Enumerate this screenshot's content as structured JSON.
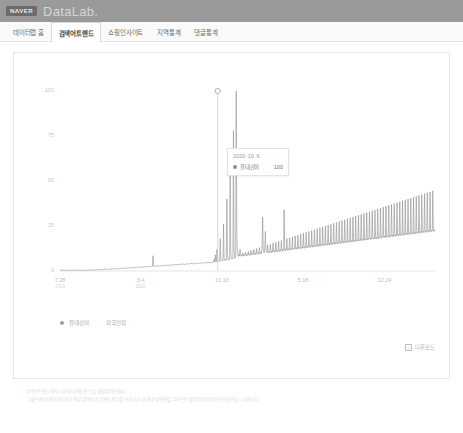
{
  "header": {
    "brand_logo": "NAVER",
    "product_name": "DataLab.",
    "bar_color": "#9a9a9a"
  },
  "nav": {
    "tabs": [
      {
        "label": "데이터랩 홈",
        "active": false
      },
      {
        "label": "검색어트렌드",
        "active": true
      },
      {
        "label": "쇼핑인사이트",
        "active": false
      },
      {
        "label": "지역통계",
        "active": false
      },
      {
        "label": "댓글통계",
        "active": false
      }
    ]
  },
  "tooltip": {
    "date": "2020. 10. 6.",
    "series_name": "유대감이",
    "value": "100",
    "dot_color": "#8e8e8e"
  },
  "legend": {
    "items": [
      {
        "label": "유대감이"
      },
      {
        "label": "외국인의"
      }
    ],
    "dot_color": "#9e9e9e"
  },
  "actions": {
    "download_label": "다운로드",
    "download_icon": "download-icon"
  },
  "footer": {
    "bullet": "·",
    "notes": [
      "검색어트렌드에서 기간과 지역조건 등을 재설정해보세요.",
      "그래프에서 데이터에 대한 해당 검색어가 검색된 횟수를 조회기간 내 최대 검색량을 100으로 설정하여 상대적인 변화량을 나타냅니다."
    ]
  },
  "chart_data": {
    "type": "line",
    "title": "",
    "xlabel": "",
    "ylabel": "",
    "ylim": [
      0,
      100
    ],
    "yticks": [
      100,
      75,
      50,
      25,
      0
    ],
    "grid": false,
    "legend_position": "bottom-left",
    "line_color": "#8e8e8e",
    "xticks": [
      {
        "label": "7.28",
        "year": "2019",
        "pos": 0.0
      },
      {
        "label": "3.4",
        "year": "2020",
        "pos": 0.215
      },
      {
        "label": "10.10",
        "year": "",
        "pos": 0.432
      },
      {
        "label": "5.18",
        "year": "",
        "pos": 0.648
      },
      {
        "label": "12.24",
        "year": "",
        "pos": 0.865
      }
    ],
    "annotations": [
      {
        "label": "2020. 10. 6.",
        "value": 100,
        "x": 0.4205,
        "marker": "hollow-circle"
      }
    ],
    "series": [
      {
        "name": "유대감이",
        "values": [
          0.4,
          0.3,
          0.5,
          0.4,
          0.3,
          0.6,
          0.4,
          0.3,
          0.5,
          0.4,
          0.3,
          0.4,
          0.5,
          0.3,
          0.4,
          0.6,
          0.4,
          0.3,
          0.5,
          0.4,
          0.3,
          0.5,
          0.4,
          0.6,
          0.4,
          0.3,
          0.5,
          0.4,
          0.3,
          0.4,
          0.6,
          0.4,
          0.5,
          0.3,
          0.4,
          0.5,
          0.4,
          0.3,
          0.6,
          0.4,
          0.5,
          0.4,
          0.3,
          0.5,
          0.6,
          0.4,
          0.5,
          0.4,
          0.3,
          0.5,
          0.4,
          0.6,
          0.5,
          0.4,
          0.5,
          0.6,
          0.4,
          0.5,
          0.4,
          0.6,
          0.5,
          0.7,
          0.5,
          0.6,
          0.5,
          0.7,
          0.6,
          0.5,
          0.7,
          0.6,
          0.8,
          0.6,
          0.7,
          0.6,
          0.8,
          0.7,
          0.6,
          0.8,
          0.7,
          0.9,
          0.8,
          1.0,
          1.4,
          0.9,
          0.8,
          1.0,
          0.9,
          1.1,
          1.0,
          1.2,
          1.0,
          0.9,
          1.1,
          1.0,
          1.3,
          1.1,
          1.0,
          1.2,
          1.1,
          1.4,
          1.2,
          1.1,
          1.3,
          1.2,
          1.5,
          1.3,
          1.2,
          1.4,
          1.3,
          1.6,
          1.4,
          1.3,
          1.5,
          1.4,
          1.7,
          1.5,
          1.4,
          1.6,
          1.5,
          1.8,
          1.6,
          1.5,
          1.7,
          1.6,
          1.9,
          1.7,
          1.6,
          1.8,
          1.7,
          2.0,
          1.8,
          1.7,
          1.9,
          1.8,
          2.1,
          1.9,
          1.8,
          2.0,
          1.9,
          2.2,
          2.0,
          1.9,
          2.1,
          2.0,
          2.3,
          2.1,
          2.0,
          2.2,
          2.1,
          2.4,
          2.2,
          2.1,
          2.3,
          2.2,
          2.5,
          2.3,
          2.2,
          2.4,
          2.3,
          2.6,
          2.4,
          2.3,
          2.5,
          2.4,
          2.7,
          2.5,
          2.4,
          2.6,
          2.5,
          8.5,
          3.0,
          2.6,
          2.8,
          2.6,
          3.0,
          2.8,
          2.6,
          2.9,
          2.7,
          3.1,
          2.9,
          2.7,
          3.0,
          2.8,
          3.2,
          3.0,
          2.8,
          3.1,
          2.9,
          3.3,
          3.1,
          2.9,
          3.2,
          3.0,
          3.4,
          3.2,
          3.0,
          3.3,
          3.1,
          3.5,
          3.3,
          3.1,
          3.4,
          3.2,
          3.6,
          3.4,
          3.2,
          3.5,
          3.3,
          3.7,
          3.5,
          3.3,
          3.6,
          3.4,
          3.8,
          3.6,
          3.4,
          3.7,
          3.5,
          3.9,
          3.7,
          3.5,
          3.8,
          3.6,
          4.0,
          3.8,
          3.6,
          3.9,
          3.7,
          4.1,
          3.9,
          3.7,
          4.0,
          3.8,
          4.2,
          4.0,
          3.8,
          4.1,
          3.9,
          4.3,
          4.1,
          3.9,
          4.2,
          4.0,
          4.4,
          4.2,
          4.0,
          4.3,
          4.1,
          4.5,
          4.3,
          4.1,
          4.4,
          4.2,
          4.6,
          4.4,
          4.2,
          4.5,
          4.3,
          4.7,
          4.5,
          4.3,
          4.6,
          4.4,
          4.8,
          4.6,
          4.4,
          4.7,
          4.5,
          4.9,
          4.7,
          4.5,
          4.8,
          4.6,
          5.0,
          4.8,
          4.6,
          4.9,
          4.7,
          5.1,
          6.5,
          5.0,
          9.0,
          5.4,
          5.2,
          12.0,
          6.0,
          5.4,
          5.2,
          5.6,
          5.4,
          18.0,
          6.5,
          5.8,
          5.5,
          6.0,
          5.6,
          26.0,
          7.5,
          6.2,
          5.8,
          6.4,
          6.0,
          40.0,
          9.0,
          6.6,
          6.2,
          6.8,
          6.4,
          58.0,
          11.0,
          7.0,
          6.6,
          7.2,
          6.8,
          78.0,
          14.0,
          8.0,
          7.0,
          8.5,
          100.0,
          22.0,
          12.0,
          9.0,
          8.0,
          9.5,
          8.5,
          12.0,
          9.0,
          8.2,
          9.0,
          8.4,
          10.0,
          8.8,
          8.2,
          9.2,
          8.6,
          10.5,
          9.0,
          8.4,
          9.4,
          8.8,
          11.0,
          9.2,
          8.6,
          9.6,
          9.0,
          11.5,
          9.4,
          8.8,
          9.8,
          9.2,
          12.0,
          9.6,
          9.0,
          10.0,
          9.4,
          12.5,
          9.8,
          9.2,
          10.2,
          9.6,
          13.0,
          10.0,
          9.4,
          10.4,
          9.8,
          13.5,
          30.0,
          12.0,
          10.6,
          10.0,
          14.0,
          22.0,
          11.5,
          10.8,
          10.2,
          14.5,
          10.6,
          10.0,
          11.0,
          10.4,
          15.0,
          10.8,
          10.2,
          11.2,
          10.6,
          15.5,
          11.0,
          10.4,
          11.4,
          10.8,
          16.0,
          11.2,
          10.6,
          11.6,
          11.0,
          16.5,
          11.4,
          10.8,
          11.8,
          11.2,
          17.0,
          11.6,
          11.0,
          12.0,
          11.4,
          34.0,
          13.0,
          11.2,
          12.2,
          11.6,
          18.0,
          12.0,
          11.4,
          12.4,
          11.8,
          18.5,
          12.2,
          11.6,
          12.6,
          12.0,
          19.0,
          12.4,
          11.8,
          12.8,
          12.2,
          19.5,
          12.6,
          12.0,
          13.0,
          12.4,
          20.0,
          12.8,
          12.2,
          13.2,
          12.6,
          20.5,
          13.0,
          12.4,
          13.4,
          12.8,
          21.0,
          13.2,
          12.6,
          13.6,
          13.0,
          21.5,
          13.4,
          12.8,
          13.8,
          13.2,
          22.0,
          13.6,
          13.0,
          14.0,
          13.4,
          22.5,
          13.8,
          13.2,
          14.2,
          13.6,
          23.0,
          14.0,
          13.4,
          14.4,
          13.8,
          23.5,
          14.2,
          13.6,
          14.6,
          14.0,
          24.0,
          14.4,
          13.8,
          14.8,
          14.2,
          24.5,
          14.6,
          14.0,
          15.0,
          14.4,
          25.0,
          14.8,
          14.2,
          15.2,
          14.6,
          25.5,
          15.0,
          14.4,
          15.4,
          14.8,
          26.0,
          15.2,
          14.6,
          15.6,
          15.0,
          26.5,
          15.4,
          14.8,
          15.8,
          15.2,
          27.0,
          15.6,
          15.0,
          16.0,
          15.4,
          27.5,
          15.8,
          15.2,
          16.2,
          15.6,
          28.0,
          16.0,
          15.4,
          16.4,
          15.8,
          28.5,
          16.2,
          15.6,
          16.6,
          16.0,
          29.0,
          16.4,
          15.8,
          16.8,
          16.2,
          29.5,
          16.6,
          16.0,
          17.0,
          16.4,
          30.0,
          16.8,
          16.2,
          17.2,
          16.6,
          30.5,
          17.0,
          16.4,
          17.4,
          16.8,
          31.0,
          17.2,
          16.6,
          17.6,
          17.0,
          31.5,
          17.4,
          16.8,
          17.8,
          17.2,
          32.0,
          17.6,
          17.0,
          18.0,
          17.4,
          32.5,
          17.8,
          17.2,
          18.2,
          17.6,
          33.0,
          18.0,
          17.4,
          18.4,
          17.8,
          33.5,
          18.2,
          17.6,
          18.6,
          18.0,
          34.0,
          18.4,
          17.8,
          18.8,
          18.2,
          34.5,
          18.6,
          18.0,
          19.0,
          18.4,
          35.0,
          18.8,
          18.2,
          19.2,
          18.6,
          35.5,
          19.0,
          18.4,
          19.4,
          18.8,
          36.0,
          19.2,
          18.6,
          19.6,
          19.0,
          36.5,
          19.4,
          18.8,
          19.8,
          19.2,
          37.0,
          19.6,
          19.0,
          20.0,
          19.4,
          37.5,
          19.8,
          19.2,
          20.2,
          19.6,
          38.0,
          20.0,
          19.4,
          20.4,
          19.8,
          38.5,
          20.2,
          19.6,
          20.6,
          20.0,
          39.0,
          20.4,
          19.8,
          20.8,
          20.2,
          39.5,
          20.6,
          20.0,
          21.0,
          20.4,
          40.0,
          20.8,
          20.2,
          21.2,
          20.6,
          40.5,
          21.0,
          20.4,
          21.4,
          20.8,
          41.0,
          21.2,
          20.6,
          21.6,
          21.0,
          41.5,
          21.4,
          20.8,
          21.8,
          21.2,
          42.0,
          21.6,
          21.0,
          22.0,
          21.4,
          42.5,
          21.8,
          21.2,
          22.2,
          21.6,
          43.0,
          22.0,
          21.4,
          22.4,
          21.8,
          43.5,
          22.2,
          21.6,
          22.6,
          22.0,
          44.0,
          22.4,
          21.8,
          22.8,
          22.2,
          44.5,
          22.6,
          22.0,
          23.0,
          22.4
        ]
      }
    ]
  }
}
